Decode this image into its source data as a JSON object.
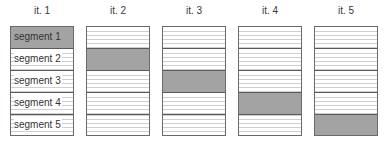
{
  "diagram": {
    "colors": {
      "active_fill": "#a3a3a3",
      "inactive_fill": "#ffffff",
      "hatch_line": "#cfcfcf",
      "border": "#6a6a6a"
    },
    "columns": [
      {
        "title": "it. 1",
        "active_segment": 1,
        "segments": [
          "segment 1",
          "segment 2",
          "segment 3",
          "segment 4",
          "segment 5"
        ]
      },
      {
        "title": "it. 2",
        "active_segment": 2,
        "segments": [
          "",
          "",
          "",
          "",
          ""
        ]
      },
      {
        "title": "it. 3",
        "active_segment": 3,
        "segments": [
          "",
          "",
          "",
          "",
          ""
        ]
      },
      {
        "title": "it. 4",
        "active_segment": 4,
        "segments": [
          "",
          "",
          "",
          "",
          ""
        ]
      },
      {
        "title": "it. 5",
        "active_segment": 5,
        "segments": [
          "",
          "",
          "",
          "",
          ""
        ]
      }
    ]
  }
}
